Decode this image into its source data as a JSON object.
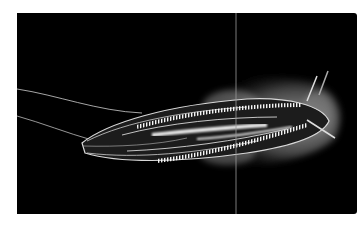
{
  "image": {
    "subject": "comb jelly (ctenophore) photographed on a black background",
    "alt": "Glowing translucent comb jelly with comb rows and trailing tentacles against black water",
    "colors": {
      "background": "#000000",
      "body_glow": "#e8e8e8",
      "comb_rows": "#ffffff",
      "page": "#ffffff"
    },
    "elements": [
      "body",
      "comb-rows",
      "gut",
      "tentacles",
      "frilly-lobes",
      "vertical-seam-line"
    ]
  }
}
